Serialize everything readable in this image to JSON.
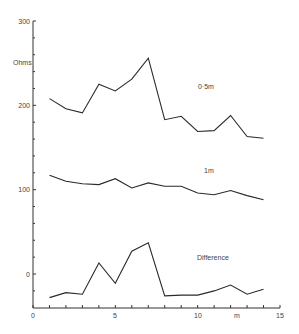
{
  "chart_data": {
    "type": "line",
    "title": "",
    "xlabel": "m",
    "ylabel": "Ohms",
    "xlim": [
      0,
      15
    ],
    "ylim": [
      -40,
      300
    ],
    "grid": false,
    "x_ticks": [
      0,
      5,
      10,
      15
    ],
    "y_ticks": [
      0,
      100,
      200,
      300
    ],
    "x": [
      1,
      2,
      3,
      4,
      5,
      6,
      7,
      8,
      9,
      10,
      11,
      12,
      13,
      14
    ],
    "series": [
      {
        "name": "0·5m",
        "values": [
          208,
          196,
          191,
          225,
          217,
          231,
          256,
          183,
          187,
          169,
          170,
          188,
          163,
          161
        ]
      },
      {
        "name": "1m",
        "values": [
          117,
          110,
          107,
          106,
          113,
          102,
          108,
          104,
          104,
          96,
          94,
          99,
          93,
          88
        ]
      },
      {
        "name": "Difference",
        "values": [
          -28,
          -22,
          -24,
          13,
          -11,
          27,
          37,
          -26,
          -25,
          -25,
          -20,
          -13,
          -24,
          -18
        ]
      }
    ],
    "annotations": [
      {
        "text": "0·5m",
        "x": 10.0,
        "y": 222
      },
      {
        "text": "1m",
        "x": 10.4,
        "y": 122
      },
      {
        "text": "Difference",
        "x": 10.0,
        "y": 20
      }
    ]
  },
  "labels": {
    "ylabel": "Ohms",
    "xlabel": "m",
    "series_0": "0·5m",
    "series_1": "1m",
    "series_2": "Difference",
    "xtick_0": "0",
    "xtick_5": "5",
    "xtick_10": "10",
    "xtick_15": "15",
    "ytick_0": "0",
    "ytick_100": "100",
    "ytick_200": "200",
    "ytick_300": "300"
  }
}
